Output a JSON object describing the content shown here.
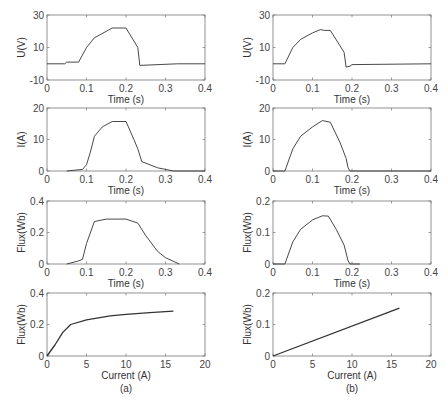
{
  "figure": {
    "captions": [
      "(a)",
      "(b)"
    ]
  },
  "chart_data": [
    {
      "id": "a-voltage",
      "panel": "(a)",
      "type": "line",
      "xlabel": "Time (s)",
      "ylabel": "U(V)",
      "xlim": [
        0,
        0.4
      ],
      "ylim": [
        -10,
        30
      ],
      "xticks": [
        0,
        0.1,
        0.2,
        0.3,
        0.4
      ],
      "yticks": [
        -10,
        10,
        30
      ],
      "x": [
        0,
        0.045,
        0.05,
        0.08,
        0.1,
        0.12,
        0.15,
        0.165,
        0.2,
        0.22,
        0.23,
        0.235,
        0.33,
        0.4
      ],
      "y": [
        0,
        0,
        1,
        1,
        10,
        16,
        20,
        22,
        22,
        14,
        10,
        -1,
        0,
        0
      ]
    },
    {
      "id": "b-voltage",
      "panel": "(b)",
      "type": "line",
      "xlabel": "Time (s)",
      "ylabel": "U(V)",
      "xlim": [
        0,
        0.4
      ],
      "ylim": [
        -10,
        30
      ],
      "xticks": [
        0,
        0.1,
        0.2,
        0.3,
        0.4
      ],
      "yticks": [
        -10,
        10,
        30
      ],
      "x": [
        0,
        0.03,
        0.05,
        0.07,
        0.1,
        0.12,
        0.13,
        0.145,
        0.17,
        0.18,
        0.185,
        0.195,
        0.2,
        0.4
      ],
      "y": [
        0,
        0,
        10,
        15,
        19,
        21,
        20.5,
        20.5,
        11,
        7,
        -2,
        -1.5,
        -0.5,
        0
      ]
    },
    {
      "id": "a-current",
      "panel": "(a)",
      "type": "line",
      "xlabel": "Time (s)",
      "ylabel": "I(A)",
      "xlim": [
        0,
        0.4
      ],
      "ylim": [
        0,
        20
      ],
      "xticks": [
        0,
        0.1,
        0.2,
        0.3,
        0.4
      ],
      "yticks": [
        0,
        10,
        20
      ],
      "x": [
        0.05,
        0.09,
        0.1,
        0.11,
        0.12,
        0.14,
        0.165,
        0.2,
        0.22,
        0.23,
        0.24,
        0.28,
        0.32,
        0.4
      ],
      "y": [
        0,
        0.5,
        2,
        6,
        11,
        14,
        15.7,
        15.7,
        10,
        7,
        3,
        1,
        0,
        0
      ]
    },
    {
      "id": "b-current",
      "panel": "(b)",
      "type": "line",
      "xlabel": "Time (s)",
      "ylabel": "I(A)",
      "xlim": [
        0,
        0.4
      ],
      "ylim": [
        0,
        20
      ],
      "xticks": [
        0,
        0.1,
        0.2,
        0.3,
        0.4
      ],
      "yticks": [
        0,
        10,
        20
      ],
      "x": [
        0,
        0.03,
        0.05,
        0.07,
        0.1,
        0.125,
        0.145,
        0.17,
        0.185,
        0.19,
        0.195,
        0.4
      ],
      "y": [
        0,
        0,
        7,
        11,
        14,
        16,
        15.5,
        9,
        4,
        1,
        0,
        0
      ]
    },
    {
      "id": "a-flux-time",
      "panel": "(a)",
      "type": "line",
      "xlabel": "Time (s)",
      "ylabel": "Flux(Wb)",
      "xlim": [
        0,
        0.4
      ],
      "ylim": [
        0,
        0.4
      ],
      "xticks": [
        0,
        0.1,
        0.2,
        0.3,
        0.4
      ],
      "yticks": [
        0,
        0.2,
        0.4
      ],
      "x": [
        0.05,
        0.08,
        0.09,
        0.1,
        0.12,
        0.15,
        0.2,
        0.23,
        0.25,
        0.28,
        0.3,
        0.335
      ],
      "y": [
        0,
        0.02,
        0.03,
        0.13,
        0.27,
        0.285,
        0.285,
        0.26,
        0.18,
        0.08,
        0.04,
        0
      ]
    },
    {
      "id": "b-flux-time",
      "panel": "(b)",
      "type": "line",
      "xlabel": "Time (s)",
      "ylabel": "Flux(Wb)",
      "xlim": [
        0,
        0.4
      ],
      "ylim": [
        0,
        0.2
      ],
      "xticks": [
        0,
        0.1,
        0.2,
        0.3,
        0.4
      ],
      "yticks": [
        0,
        0.1,
        0.2
      ],
      "x": [
        0,
        0.03,
        0.05,
        0.07,
        0.1,
        0.125,
        0.14,
        0.16,
        0.18,
        0.19,
        0.195,
        0.22
      ],
      "y": [
        0,
        0,
        0.07,
        0.11,
        0.14,
        0.153,
        0.152,
        0.11,
        0.06,
        0.01,
        0,
        0
      ]
    },
    {
      "id": "a-flux-current",
      "panel": "(a)",
      "type": "line",
      "xlabel": "Current (A)",
      "ylabel": "Flux(Wb)",
      "xlim": [
        0,
        20
      ],
      "ylim": [
        0,
        0.4
      ],
      "xticks": [
        0,
        5,
        10,
        15,
        20
      ],
      "yticks": [
        0,
        0.2,
        0.4
      ],
      "x": [
        0,
        1,
        2,
        3,
        5,
        8,
        10,
        13,
        16
      ],
      "y": [
        0,
        0.07,
        0.15,
        0.2,
        0.23,
        0.255,
        0.265,
        0.275,
        0.285
      ]
    },
    {
      "id": "b-flux-current",
      "panel": "(b)",
      "type": "line",
      "xlabel": "Current (A)",
      "ylabel": "Flux(Wb)",
      "xlim": [
        0,
        20
      ],
      "ylim": [
        0,
        0.2
      ],
      "xticks": [
        0,
        5,
        10,
        15,
        20
      ],
      "yticks": [
        0,
        0.1,
        0.2
      ],
      "x": [
        0,
        16
      ],
      "y": [
        0,
        0.152
      ]
    }
  ]
}
